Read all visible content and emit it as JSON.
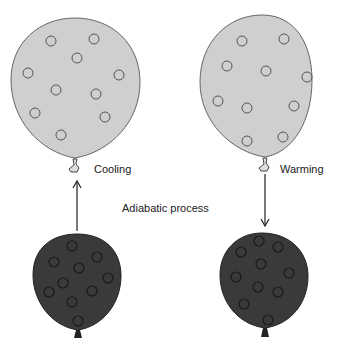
{
  "diagram": {
    "labels": {
      "cooling": "Cooling",
      "warming": "Warming",
      "process": "Adiabatic process"
    },
    "colors": {
      "expanded_fill": "#cfcfcf",
      "compressed_fill": "#3a3a3a",
      "outline": "#555555",
      "arrow": "#222222"
    },
    "balloons": [
      {
        "id": "left-top",
        "state": "expanded",
        "label": "Cooling"
      },
      {
        "id": "right-top",
        "state": "expanded",
        "label": "Warming"
      },
      {
        "id": "left-bottom",
        "state": "compressed"
      },
      {
        "id": "right-bottom",
        "state": "compressed"
      }
    ],
    "arrows": [
      {
        "from": "left-bottom",
        "to": "left-top",
        "direction": "up"
      },
      {
        "from": "right-top",
        "to": "right-bottom",
        "direction": "down"
      }
    ]
  }
}
